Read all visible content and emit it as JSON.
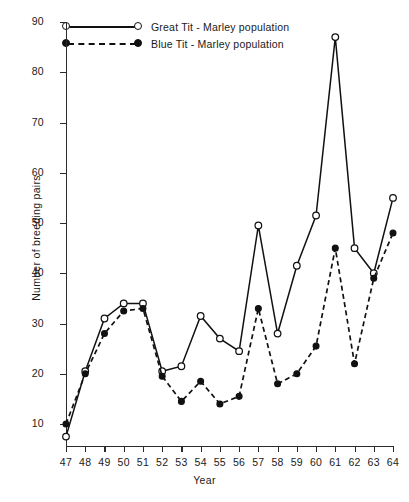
{
  "chart_data": {
    "type": "line",
    "title": "",
    "xlabel": "Year",
    "ylabel": "Number of breeding pairs",
    "x": [
      47,
      48,
      49,
      50,
      51,
      52,
      53,
      54,
      55,
      56,
      57,
      58,
      59,
      60,
      61,
      62,
      63,
      64
    ],
    "xtick_labels": [
      "47",
      "48",
      "49",
      "50",
      "51",
      "52",
      "53",
      "54",
      "55",
      "56",
      "57",
      "58",
      "59",
      "60",
      "61",
      "62",
      "63",
      "64"
    ],
    "ytick_labels": [
      "10",
      "20",
      "30",
      "40",
      "50",
      "60",
      "70",
      "80",
      "90"
    ],
    "ytick_values": [
      10,
      20,
      30,
      40,
      50,
      60,
      70,
      80,
      90
    ],
    "ylim": [
      4,
      90
    ],
    "xlim": [
      47,
      64
    ],
    "grid": false,
    "legend_position": "top-left",
    "series": [
      {
        "name": "Great Tit - Marley population",
        "marker": "open-circle",
        "line_style": "solid",
        "color": "#111111",
        "values": [
          7.5,
          20.5,
          31,
          34,
          34,
          20.5,
          21.5,
          31.5,
          27,
          24.5,
          49.5,
          28,
          41.5,
          51.5,
          87,
          45,
          40,
          55
        ]
      },
      {
        "name": "Blue Tit - Marley population",
        "marker": "filled-circle",
        "line_style": "dashed",
        "color": "#111111",
        "values": [
          10,
          20,
          28,
          32.5,
          33,
          19.5,
          14.5,
          18.5,
          14,
          15.5,
          33,
          18,
          20,
          25.5,
          45,
          22,
          39,
          48
        ]
      }
    ]
  },
  "legend": {
    "items": [
      {
        "label": "Great Tit - Marley population",
        "style": "solid-open"
      },
      {
        "label": "Blue Tit - Marley population",
        "style": "dashed-filled"
      }
    ]
  },
  "axes": {
    "y_title": "Number of breeding pairs",
    "x_title": "Year"
  }
}
